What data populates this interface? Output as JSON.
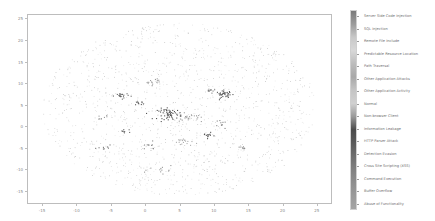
{
  "chart_data": {
    "type": "scatter",
    "title": "",
    "xlabel": "",
    "ylabel": "",
    "xlim": [
      -17.2,
      27.2
    ],
    "ylim": [
      -18,
      26
    ],
    "x_ticks": [
      -15,
      -10,
      -5,
      0,
      5,
      10,
      15,
      20,
      25
    ],
    "y_ticks": [
      25,
      20,
      15,
      10,
      5,
      0,
      -5,
      -10,
      -15
    ],
    "grid": false,
    "legend_position": "right (colorbar)",
    "colorbar_labels": [
      "Server Side Code Injection",
      "SQL Injection",
      "Remote File Include",
      "Predictable Resource Location",
      "Path Traversal",
      "Other Application Attacks",
      "Other Application Activity",
      "Normal",
      "Non-browser Client",
      "Information Leakage",
      "HTTP Parser Attack",
      "Detection Evasion",
      "Cross Site Scripting (XSS)",
      "Command Execution",
      "Buffer Overflow",
      "Abuse of Functionality"
    ],
    "colorbar_colors": [
      "#7a7a7a",
      "#9c9c9c",
      "#c8c8c8",
      "#d8d8d8",
      "#bcbcbc",
      "#a8a8a8",
      "#c4c4c4",
      "#d0d0d0",
      "#9a9a9a",
      "#4a4a4a",
      "#5a5a5a",
      "#6e6e6e",
      "#808080",
      "#8e8e8e",
      "#9a9a9a",
      "#a4a4a4"
    ],
    "background_cloud": {
      "center": [
        5,
        4
      ],
      "radius_x": 20,
      "radius_y": 20,
      "count": 1400,
      "color": "#cfcfcf"
    },
    "clusters": [
      {
        "x": 3.5,
        "y": 3.0,
        "spread": 0.9,
        "count": 60,
        "color": "#555555"
      },
      {
        "x": 11.5,
        "y": 7.5,
        "spread": 0.6,
        "count": 35,
        "color": "#5a5a5a"
      },
      {
        "x": -3.5,
        "y": 7.2,
        "spread": 0.5,
        "count": 22,
        "color": "#6a6a6a"
      },
      {
        "x": 1.0,
        "y": 10.5,
        "spread": 0.6,
        "count": 14,
        "color": "#9a9a9a"
      },
      {
        "x": 6.5,
        "y": 2.0,
        "spread": 0.8,
        "count": 20,
        "color": "#a0a0a0"
      },
      {
        "x": 5.5,
        "y": -3.5,
        "spread": 0.7,
        "count": 18,
        "color": "#b0b0b0"
      },
      {
        "x": 9.0,
        "y": -2.0,
        "spread": 0.4,
        "count": 12,
        "color": "#555555"
      },
      {
        "x": -1.0,
        "y": 5.5,
        "spread": 0.4,
        "count": 10,
        "color": "#5e5e5e"
      },
      {
        "x": 9.5,
        "y": 8.5,
        "spread": 0.4,
        "count": 10,
        "color": "#7a7a7a"
      },
      {
        "x": -3.0,
        "y": -1.0,
        "spread": 0.4,
        "count": 8,
        "color": "#6a6a6a"
      },
      {
        "x": 11.0,
        "y": 0.5,
        "spread": 0.5,
        "count": 10,
        "color": "#888888"
      },
      {
        "x": 3.0,
        "y": -10.0,
        "spread": 1.2,
        "count": 12,
        "color": "#9a9a9a"
      },
      {
        "x": -6.0,
        "y": -5.0,
        "spread": 0.5,
        "count": 8,
        "color": "#777777"
      },
      {
        "x": 0.5,
        "y": -4.5,
        "spread": 0.6,
        "count": 10,
        "color": "#888888"
      },
      {
        "x": 14.0,
        "y": -5.0,
        "spread": 0.5,
        "count": 8,
        "color": "#8e8e8e"
      },
      {
        "x": -6.5,
        "y": 2.0,
        "spread": 0.5,
        "count": 8,
        "color": "#999999"
      }
    ]
  }
}
